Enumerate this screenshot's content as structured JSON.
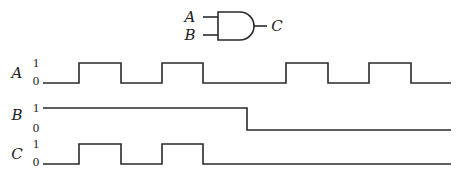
{
  "gate": {
    "type": "AND",
    "inputs": [
      "A",
      "B"
    ],
    "output": "C",
    "labels": {
      "a": "A",
      "b": "B",
      "c": "C"
    }
  },
  "timing": {
    "level_labels": {
      "high": "1",
      "low": "0"
    },
    "x_start": 43,
    "x_end": 451,
    "signals": [
      {
        "name": "A",
        "y_high": 63,
        "y_low": 83,
        "label_y": 78,
        "initial": 0,
        "transitions": [
          79,
          121,
          162,
          203,
          286,
          328,
          369,
          411
        ]
      },
      {
        "name": "B",
        "y_high": 108,
        "y_low": 130,
        "label_y": 120,
        "initial": 1,
        "transitions": [
          247
        ]
      },
      {
        "name": "C",
        "y_high": 144,
        "y_low": 164,
        "label_y": 159,
        "initial": 0,
        "transitions": [
          79,
          121,
          162,
          203
        ]
      }
    ]
  },
  "colors": {
    "line": "#2a2a2a",
    "background": "#ffffff"
  }
}
